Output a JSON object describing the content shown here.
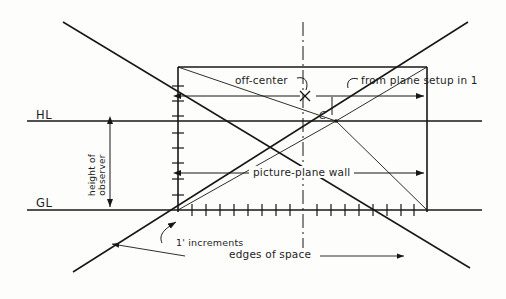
{
  "diagram": {
    "ink_color": "#171717",
    "paper_color": "#fdfdfc",
    "labels": {
      "horizon_line": "HL",
      "ground_line": "GL",
      "height_of_observer_line1": "height of",
      "height_of_observer_line2": "observer",
      "off_center": "off-center",
      "from_plane_setup": "from plane setup in 1",
      "center_point": "C",
      "picture_plane_wall": "picture-plane wall",
      "increments": "1' increments",
      "edges_of_space": "edges of space"
    },
    "geometry": {
      "hl_y": 121,
      "gl_y": 210,
      "left_wall_x": 178,
      "right_wall_x": 427,
      "center_x": 303,
      "vanishing_point_x": 336,
      "vanishing_point_y": 121,
      "wall_top_y": 67,
      "hl_x_start": 27,
      "hl_x_end": 482,
      "gl_x_start": 27,
      "gl_x_end": 482,
      "increment_count": 18
    }
  }
}
